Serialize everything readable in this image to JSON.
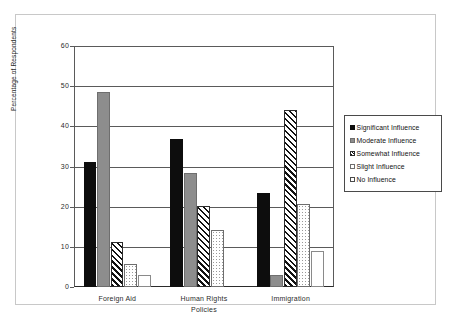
{
  "chart_data": {
    "type": "bar",
    "title": "",
    "xlabel": "",
    "ylabel": "Percentage of Respondents",
    "categories": [
      "Foreign Aid",
      "Human Rights Policies",
      "Immigration"
    ],
    "category_lines": [
      [
        "Foreign Aid"
      ],
      [
        "Human Rights",
        "Policies"
      ],
      [
        "Immigration"
      ]
    ],
    "ylim": [
      0,
      60
    ],
    "yticks": [
      0,
      10,
      20,
      30,
      40,
      50,
      60
    ],
    "ytick_labels": [
      "0",
      "10",
      "20",
      "30",
      "40",
      "50",
      "60"
    ],
    "grid": true,
    "legend_position": "right",
    "series": [
      {
        "name": "Significant Influence",
        "pattern": "solid-black",
        "color": "#0d0d0d",
        "values": [
          31.2,
          36.8,
          23.4
        ]
      },
      {
        "name": "Moderate Influence",
        "pattern": "solid-gray",
        "color": "#8d8d8d",
        "values": [
          48.5,
          28.5,
          3.0
        ]
      },
      {
        "name": "Somewhat Influence",
        "pattern": "hatch",
        "color": "#ffffff",
        "values": [
          11.2,
          20.1,
          44.0
        ]
      },
      {
        "name": "Slight Influence",
        "pattern": "dots",
        "color": "#ffffff",
        "values": [
          5.7,
          14.2,
          20.6
        ]
      },
      {
        "name": "No Influence",
        "pattern": "empty",
        "color": "#ffffff",
        "values": [
          3.0,
          0.0,
          9.0
        ]
      }
    ]
  },
  "colors": {
    "axis": "#5a5a5a",
    "baseline": "#2b2b2b",
    "frame": "#c8c8c8",
    "text": "#2b2b2b",
    "background": "#ffffff"
  }
}
